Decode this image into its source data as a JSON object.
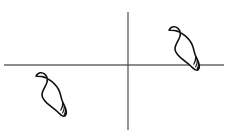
{
  "figure": {
    "background_color": "#ffffff",
    "width": 230,
    "height": 133
  },
  "chart_data": {
    "type": "scatter",
    "title": "",
    "xlabel": "",
    "ylabel": "",
    "grid": false,
    "legend": null,
    "axes": {
      "origin_px": [
        128,
        65
      ],
      "x_axis": {
        "from_px": [
          4,
          65
        ],
        "to_px": [
          224,
          65
        ],
        "color": "#1a1a1a",
        "width_px": 1.2
      },
      "y_axis": {
        "from_px": [
          128,
          12
        ],
        "to_px": [
          128,
          130
        ],
        "color": "#4d4d4d",
        "width_px": 1.2
      }
    },
    "categories": [
      "right-foot",
      "left-foot"
    ],
    "values": [
      1,
      1
    ],
    "points": [
      {
        "name": "upper-right-footprint",
        "quadrant": "I",
        "center_px": [
          185,
          48
        ],
        "rotation_deg": 38,
        "length_px": 48,
        "width_px": 20,
        "toe_count": 4,
        "touching_axis": "x-axis"
      },
      {
        "name": "lower-left-footprint",
        "quadrant": "III",
        "center_px": [
          52,
          94
        ],
        "rotation_deg": 38,
        "length_px": 48,
        "width_px": 20,
        "toe_count": 4,
        "touching_axis": "none"
      }
    ]
  },
  "style": {
    "stroke_color": "#111111",
    "axis_x_color": "#1a1a1a",
    "axis_y_color": "#4d4d4d",
    "fill_color": "#ffffff",
    "foot_stroke_width": 1.6,
    "toe_stroke_width": 1.2
  },
  "labels": {
    "x_axis_label": "",
    "y_axis_label": "",
    "origin_label": "",
    "caption": ""
  }
}
